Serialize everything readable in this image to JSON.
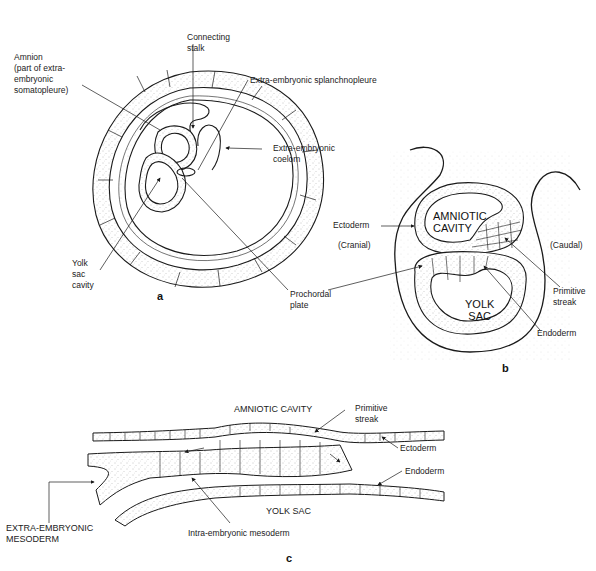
{
  "figure": {
    "panels": [
      {
        "id": "a",
        "panel_label": "a",
        "labels": {
          "connecting_stalk": "Connecting\nstalk",
          "amnion": "Amnion\n(part of extra-\nembryonic\nsomatopleure)",
          "splanchnopleure": "Extra-embryonic splanchnopleure",
          "coelom": "Extra-embryonic\ncoelom",
          "yolk_sac_cavity": "Yolk\nsac\ncavity",
          "prochordal_plate": "Prochordal\nplate"
        }
      },
      {
        "id": "b",
        "panel_label": "b",
        "labels": {
          "amniotic_cavity": "AMNIOTIC\nCAVITY",
          "yolk_sac": "YOLK\nSAC",
          "ectoderm": "Ectoderm",
          "cranial": "(Cranial)",
          "caudal": "(Caudal)",
          "primitive_streak": "Primitive\nstreak",
          "endoderm": "Endoderm"
        }
      },
      {
        "id": "c",
        "panel_label": "c",
        "labels": {
          "amniotic_cavity": "AMNIOTIC CAVITY",
          "primitive_streak": "Primitive\nstreak",
          "ectoderm": "Ectoderm",
          "endoderm": "Endoderm",
          "yolk_sac": "YOLK SAC",
          "extra_embryonic_mesoderm": "EXTRA-EMBRYONIC\nMESODERM",
          "intra_embryonic_mesoderm": "Intra-embryonic mesoderm"
        }
      }
    ],
    "colors": {
      "line": "#1a1a1a",
      "stipple": "#9a9a9a",
      "background": "#ffffff"
    }
  }
}
